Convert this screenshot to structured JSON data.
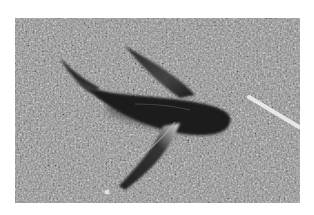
{
  "image": {
    "subject": "flying fish lying on textured pavement",
    "tone": "grayscale",
    "colors": {
      "background": "#ffffff",
      "pavement": "#8a8a8a",
      "fish": "#1a1a1a",
      "stick": "#e6e6e6"
    }
  },
  "caption": "Flying fish on textured ground"
}
